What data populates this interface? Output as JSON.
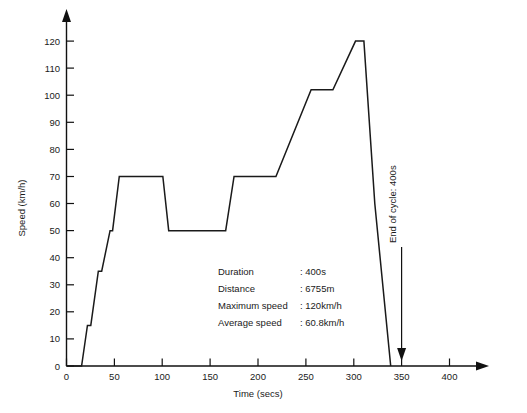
{
  "chart_data": {
    "type": "line",
    "title": "",
    "xlabel": "Time (secs)",
    "ylabel": "Speed (km/h)",
    "xlim": [
      0,
      400
    ],
    "ylim": [
      0,
      120
    ],
    "xticks": [
      0,
      50,
      100,
      150,
      200,
      250,
      300,
      350,
      400
    ],
    "xtick_labels": [
      "0",
      "50",
      "100",
      "150",
      "200",
      "250",
      "300",
      "350",
      "400"
    ],
    "yticks": [
      0,
      10,
      20,
      30,
      40,
      50,
      60,
      70,
      80,
      90,
      100,
      110,
      120
    ],
    "ytick_labels": [
      "0",
      "10",
      "20",
      "30",
      "40",
      "50",
      "60",
      "70",
      "80",
      "90",
      "100",
      "110",
      "120"
    ],
    "grid": false,
    "legend": "none",
    "series": [
      {
        "name": "Speed profile",
        "color": "#1a1a1a",
        "x": [
          0,
          18,
          25,
          29,
          38,
          42,
          52,
          55,
          63,
          115,
          122,
          190,
          200,
          250,
          292,
          318,
          345,
          355,
          368,
          387
        ],
        "y": [
          0,
          0,
          15,
          15,
          35,
          35,
          50,
          50,
          70,
          70,
          50,
          50,
          70,
          70,
          102,
          102,
          120,
          120,
          60,
          0
        ]
      }
    ],
    "annotations": [
      {
        "label": "End of cycle: 400s",
        "x": 400,
        "y": 0
      }
    ]
  },
  "info_panel": {
    "rows": [
      {
        "label": "Duration",
        "separator": ":",
        "value": "400s"
      },
      {
        "label": "Distance",
        "separator": ":",
        "value": "6755m"
      },
      {
        "label": "Maximum speed",
        "separator": ":",
        "value": "120km/h"
      },
      {
        "label": "Average speed",
        "separator": ":",
        "value": "60.8km/h"
      }
    ]
  },
  "end_of_cycle": {
    "text": "End of cycle: 400s"
  },
  "axes": {
    "x_title": "Time (secs)",
    "y_title": "Speed (km/h)"
  },
  "colors": {
    "line": "#1a1a1a",
    "axis": "#111111",
    "background": "#ffffff"
  }
}
